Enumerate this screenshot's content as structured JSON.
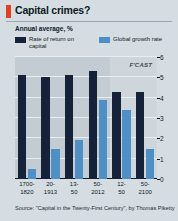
{
  "header": {
    "title": "Capital crimes?",
    "kicker_color": "#e3401f",
    "subtitle": "Annual average, %"
  },
  "legend": {
    "items": [
      {
        "label": "Rate of return on capital",
        "color": "#16213a",
        "swatch_name": "legend-swatch-rate-of-return"
      },
      {
        "label": "Global growth rate",
        "color": "#4e90c6",
        "swatch_name": "legend-swatch-global-growth"
      }
    ]
  },
  "annotations": {
    "forecast_label": "F'CAST"
  },
  "footer": {
    "source": "Source: \"Capital in the Twenty-First Century\", by Thomas Piketty"
  },
  "chart_data": {
    "type": "bar",
    "title": "Capital crimes?",
    "subtitle": "Annual average, %",
    "xlabel": "",
    "ylabel": "Annual average, %",
    "ylim": [
      0,
      6
    ],
    "yticks": [
      0,
      1,
      2,
      3,
      4,
      5,
      6
    ],
    "ytick_labels": [
      "0",
      "1",
      "2",
      "3",
      "4",
      "5",
      "6"
    ],
    "y_axis_position": "right",
    "grid": true,
    "legend_position": "top",
    "categories": [
      "1700-\n1820",
      "20-\n1913",
      "13-\n50",
      "50-\n2012",
      "12-\n50",
      "50-\n2100"
    ],
    "series": [
      {
        "name": "Rate of return on capital",
        "color": "#16213a",
        "values": [
          5.1,
          5.0,
          5.1,
          5.3,
          4.3,
          4.3
        ]
      },
      {
        "name": "Global growth rate",
        "color": "#4e90c6",
        "values": [
          0.5,
          1.5,
          1.9,
          3.9,
          3.4,
          1.5
        ]
      }
    ],
    "forecast_from_category_index": 4,
    "forecast_label": "F'CAST",
    "source": "Source: \"Capital in the Twenty-First Century\", by Thomas Piketty"
  }
}
